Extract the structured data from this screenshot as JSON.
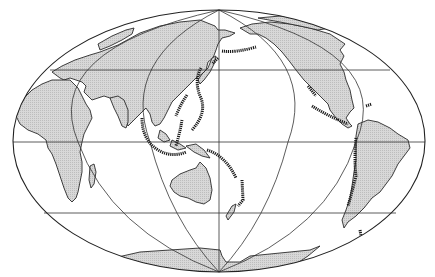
{
  "map": {
    "projection": "elliptical world map, Pacific-centered",
    "graticule": {
      "parallels": [
        "60N",
        "0",
        "60S"
      ],
      "meridians": [
        "-120",
        "-60",
        "0",
        "60",
        "120"
      ]
    },
    "colors": {
      "background": "#ffffff",
      "land_fill": "#d6d6d6",
      "land_hatch": "#bcbcbc",
      "outline": "#222222",
      "trench": "#1a1a1a"
    },
    "features": {
      "landmasses": [
        "Eurasia",
        "Africa",
        "Australia",
        "North America",
        "South America",
        "Antarctica",
        "Madagascar",
        "Japan",
        "Indonesia",
        "New Zealand",
        "Greenland"
      ],
      "highlighted": "oceanic trenches / subduction zones (thick dashed lines)",
      "trenches": [
        "Aleutian",
        "Kuril-Kamchatka",
        "Japan",
        "Izu-Bonin-Mariana",
        "Ryukyu",
        "Philippine",
        "Java-Sunda",
        "New Britain",
        "Tonga-Kermadec",
        "Middle America",
        "Peru-Chile",
        "South Sandwich"
      ]
    }
  }
}
